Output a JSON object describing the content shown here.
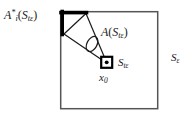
{
  "figure": {
    "background_color": "#ffffff",
    "stroke_color": "#1a1a1a",
    "thick_stroke_color": "#000000",
    "labels": {
      "a_star_base": "A",
      "a_star_sub": "i",
      "a_star_sup": "*",
      "a_star_arg_open": "(",
      "a_star_arg_base": "S",
      "a_star_arg_sub": "tε",
      "a_star_arg_close": ")",
      "a_cone_base": "A",
      "a_cone_arg_open": "(",
      "a_cone_arg_base": "S",
      "a_cone_arg_sub": "tε",
      "a_cone_arg_close": ")",
      "s_teps_base": "S",
      "s_teps_sub": "tε",
      "x0_base": "x",
      "x0_sub": "0",
      "s_eps_base": "S",
      "s_eps_sub": "ε"
    },
    "geometry": {
      "outer_square": {
        "x": 60,
        "y": 11,
        "width": 98,
        "height": 98,
        "stroke_width": 1.4
      },
      "apex_square": {
        "x": 101,
        "y": 57,
        "width": 11,
        "height": 11,
        "stroke_width": 2.2
      },
      "apex_dot": {
        "cx": 106.5,
        "cy": 62.5,
        "r": 1.9
      },
      "cone_apex": {
        "x": 106.5,
        "cy": 62.5
      },
      "cone_ray_upper_end": {
        "x": 64,
        "y": 13
      },
      "cone_ray_lower_end": {
        "x": 64,
        "y": 34
      },
      "thick_top_edge": {
        "x1": 61,
        "y1": 12,
        "x2": 87,
        "y2": 12,
        "stroke_width": 3.4
      },
      "thick_left_edge": {
        "x1": 62,
        "y1": 12,
        "x2": 62,
        "y2": 35,
        "stroke_width": 3.4
      },
      "cap_chord": {
        "x1": 87,
        "y1": 13,
        "x2": 64,
        "y2": 34
      },
      "ellipse": {
        "cx": 92,
        "cy": 44,
        "rx": 5.2,
        "ry": 8.2,
        "rotation": 28
      }
    }
  }
}
